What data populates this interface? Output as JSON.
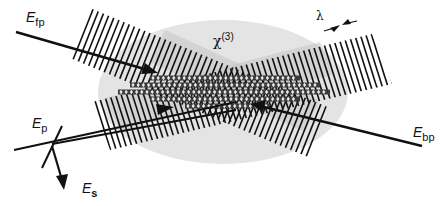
{
  "diagram": {
    "medium": {
      "label": "χ",
      "superscript": "(3)",
      "fill": "#e4e4e4"
    },
    "wavelength_label": "λ",
    "beams": [
      {
        "id": "fp",
        "label_main": "E",
        "label_sub": "fp",
        "role": "forward pump"
      },
      {
        "id": "bp",
        "label_main": "E",
        "label_sub": "bp",
        "role": "backward pump"
      },
      {
        "id": "p",
        "label_main": "E",
        "label_sub": "p",
        "role": "probe"
      },
      {
        "id": "s",
        "label_main": "E",
        "label_sub": "s",
        "role": "signal"
      }
    ],
    "colors": {
      "line": "#111111",
      "beam_shade": "#bdbdbd",
      "grating": "#333333"
    }
  }
}
